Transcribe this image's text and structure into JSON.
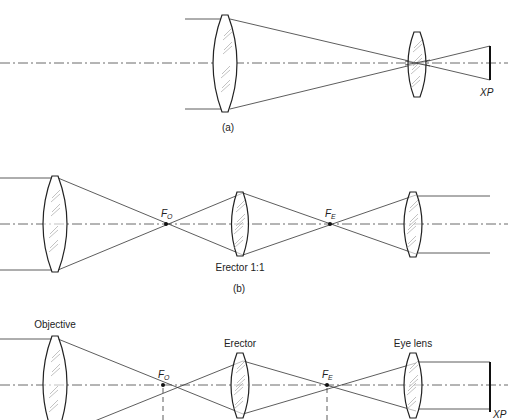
{
  "figure": {
    "top_caption_fragment": "(Figure ...)",
    "panels": [
      {
        "id": "a",
        "caption": "(a)",
        "description": "Simple Keplerian telescope: objective and eye lens with exit pupil",
        "labels": {
          "exit_pupil": "XP"
        }
      },
      {
        "id": "b",
        "caption": "(b)",
        "description": "Telescope with 1:1 erector lens between objective and eyepiece foci",
        "labels": {
          "objective_focus": "F",
          "objective_focus_sub": "O",
          "eyepiece_focus": "F",
          "eyepiece_focus_sub": "E",
          "erector": "Erector 1:1"
        }
      },
      {
        "id": "c",
        "caption": "",
        "description": "Terrestrial telescope with objective, erector and eye lens",
        "labels": {
          "objective": "Objective",
          "erector": "Erector",
          "eye_lens": "Eye lens",
          "objective_focus": "F",
          "objective_focus_sub": "O",
          "eyepiece_focus": "F",
          "eyepiece_focus_sub": "E",
          "exit_pupil": "XP"
        }
      }
    ]
  }
}
